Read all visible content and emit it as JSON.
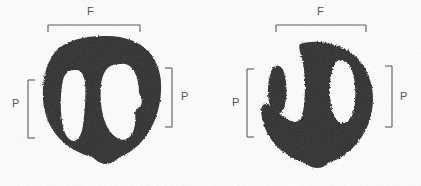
{
  "figure": {
    "width": 421,
    "height": 186,
    "background_color": "#ffffff",
    "ink_color": "#2d2d2d",
    "annotation_color": "#555555",
    "label_color": "#4a4a4a"
  },
  "tracks": [
    {
      "id": "left-track",
      "name": "left-track-impression",
      "measurements": [
        {
          "id": "left-track-f",
          "label": "F",
          "orientation": "horizontal",
          "position": "top",
          "bracket": {
            "x1": 48,
            "x2": 140,
            "line_y": 25,
            "tick_length": 7
          },
          "label_x": 90,
          "label_y": 6
        },
        {
          "id": "left-track-p-left",
          "label": "P",
          "orientation": "vertical",
          "position": "left",
          "bracket": {
            "y1": 80,
            "y2": 138,
            "line_x": 28,
            "tick_length": 7
          },
          "label_x": 12,
          "label_y": 103
        },
        {
          "id": "left-track-p-right",
          "label": "P",
          "orientation": "vertical",
          "position": "right",
          "bracket": {
            "y1": 68,
            "y2": 127,
            "line_x": 172,
            "tick_length": 7
          },
          "label_x": 181,
          "label_y": 92
        }
      ]
    },
    {
      "id": "right-track",
      "name": "right-track-impression",
      "measurements": [
        {
          "id": "right-track-f",
          "label": "F",
          "orientation": "horizontal",
          "position": "top",
          "bracket": {
            "x1": 276,
            "x2": 366,
            "line_y": 25,
            "tick_length": 7
          },
          "label_x": 317,
          "label_y": 6
        },
        {
          "id": "right-track-p-left",
          "label": "P",
          "orientation": "vertical",
          "position": "left",
          "bracket": {
            "y1": 69,
            "y2": 137,
            "line_x": 247,
            "tick_length": 7
          },
          "label_x": 232,
          "label_y": 98
        },
        {
          "id": "right-track-p-right",
          "label": "P",
          "orientation": "vertical",
          "position": "right",
          "bracket": {
            "y1": 66,
            "y2": 127,
            "line_x": 392,
            "tick_length": 7
          },
          "label_x": 400,
          "label_y": 92
        }
      ]
    }
  ],
  "labels": {
    "left_f": "F",
    "left_p_left": "P",
    "left_p_right": "P",
    "right_f": "F",
    "right_p_left": "P",
    "right_p_right": "P"
  }
}
